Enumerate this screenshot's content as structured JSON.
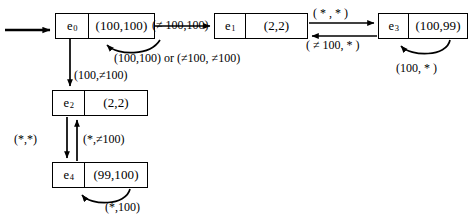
{
  "diagram": {
    "type": "state-transition-diagram",
    "stroke_color": "#000000",
    "background_color": "#ffffff",
    "states": [
      {
        "id": "e0",
        "id_text": "e",
        "id_sub": "0",
        "value": "(100,100)",
        "x": 55,
        "y": 13,
        "w": 100,
        "h": 26,
        "id_w": 33
      },
      {
        "id": "e1",
        "id_text": "e",
        "id_sub": "1",
        "value": "(2,2)",
        "x": 214,
        "y": 13,
        "w": 94,
        "h": 26,
        "id_w": 31
      },
      {
        "id": "e3",
        "id_text": "e",
        "id_sub": "3",
        "value": "(100,99)",
        "x": 378,
        "y": 13,
        "w": 90,
        "h": 26,
        "id_w": 30
      },
      {
        "id": "e2",
        "id_text": "e",
        "id_sub": "2",
        "value": "(2,2)",
        "x": 52,
        "y": 90,
        "w": 96,
        "h": 26,
        "id_w": 32
      },
      {
        "id": "e4",
        "id_text": "e",
        "id_sub": "4",
        "value": "(99,100)",
        "x": 52,
        "y": 162,
        "w": 96,
        "h": 26,
        "id_w": 32
      }
    ],
    "transitions": [
      {
        "from": "start",
        "to": "e0",
        "label": ""
      },
      {
        "from": "e0",
        "to": "e1",
        "label": "(≠ 100,100)"
      },
      {
        "from": "e0",
        "to": "e0",
        "label": "(100,100) or (≠100, ≠100)"
      },
      {
        "from": "e0",
        "to": "e2",
        "label": "(100,≠100)"
      },
      {
        "from": "e1",
        "to": "e3",
        "label": "( * , * )"
      },
      {
        "from": "e3",
        "to": "e1",
        "label": "( ≠ 100, * )"
      },
      {
        "from": "e3",
        "to": "e3",
        "label": "(100, * )"
      },
      {
        "from": "e2",
        "to": "e4",
        "label": "(*,*)"
      },
      {
        "from": "e4",
        "to": "e2",
        "label": "(*,≠100)"
      },
      {
        "from": "e4",
        "to": "e4",
        "label": "(*,100)"
      }
    ],
    "labels": {
      "e0_to_e1": "(≠ 100,100)",
      "e0_self": "(100,100) or (≠100, ≠100)",
      "e0_to_e2": "(100,≠100)",
      "e1_to_e3": "( * , * )",
      "e3_to_e1": "( ≠ 100, * )",
      "e3_self": "(100, * )",
      "e2_to_e4": "(*,*)",
      "e4_to_e2": "(*,≠100)",
      "e4_self": "(*,100)"
    }
  }
}
